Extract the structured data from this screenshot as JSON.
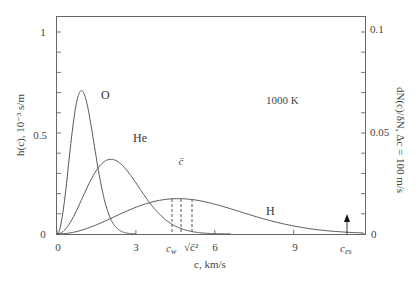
{
  "chart_data": {
    "type": "line",
    "title": "",
    "annotation": "1000 K",
    "xlabel": "c, km/s",
    "ylabel": "h(c), 10^-3 s/m",
    "ylabel_right": "dN(c)/δN, Δc = 100 m/s",
    "xlim": [
      0,
      11.6
    ],
    "ylim": [
      0,
      1.0
    ],
    "ylim_right": [
      0,
      0.1
    ],
    "x_ticks": [
      0,
      3,
      6,
      9
    ],
    "x_tick_labels": [
      "0",
      "3",
      "6",
      "9"
    ],
    "y_ticks": [
      0,
      0.5,
      1
    ],
    "y_tick_labels": [
      "0",
      "0.5",
      "1"
    ],
    "y_minor_step": 0.1,
    "y_right_ticks": [
      0,
      0.05,
      0.1
    ],
    "y_right_tick_labels": [
      "0",
      "0.05",
      "0.1"
    ],
    "grid": false,
    "legend": "inline labels",
    "series": [
      {
        "name": "O",
        "peak_c": 0.93,
        "peak_h": 0.71,
        "x": [
          0,
          0.25,
          0.5,
          0.75,
          0.93,
          1.25,
          1.5,
          2.0,
          2.5,
          2.9
        ],
        "values": [
          0,
          0.12,
          0.42,
          0.66,
          0.71,
          0.6,
          0.44,
          0.15,
          0.03,
          0.0
        ]
      },
      {
        "name": "He",
        "peak_c": 2.05,
        "peak_h": 0.37,
        "x": [
          0,
          0.5,
          1.0,
          1.5,
          2.05,
          2.5,
          3.0,
          3.5,
          4.0,
          4.5,
          5.0,
          5.5,
          6.0
        ],
        "values": [
          0,
          0.07,
          0.2,
          0.32,
          0.37,
          0.34,
          0.26,
          0.16,
          0.09,
          0.04,
          0.015,
          0.005,
          0.0
        ]
      },
      {
        "name": "H",
        "peak_c": 4.6,
        "peak_h": 0.175,
        "x": [
          0,
          1,
          2,
          3,
          4,
          4.6,
          5,
          6,
          7,
          8,
          9,
          10,
          11,
          11.5
        ],
        "values": [
          0,
          0.02,
          0.07,
          0.125,
          0.17,
          0.175,
          0.172,
          0.155,
          0.12,
          0.085,
          0.05,
          0.025,
          0.01,
          0.0
        ]
      }
    ],
    "markers": [
      {
        "label": "c_w",
        "x": 4.3,
        "style": "dashed"
      },
      {
        "label": "c̄",
        "x": 4.65,
        "style": "dashed"
      },
      {
        "label": "√(c̄²)",
        "x": 5.1,
        "style": "dashed"
      },
      {
        "label": "c_es",
        "x": 11.0,
        "style": "arrow"
      }
    ]
  },
  "labels": {
    "O": "O",
    "He": "He",
    "H": "H",
    "temp": "1000 K",
    "xlabel": "c, km/s",
    "ylabel": "h(c), 10⁻³ s/m",
    "ylabel_right": "dN(c)/δN, Δc = 100 m/s",
    "cw": "c",
    "cw_sub": "w",
    "cbar": "c̄",
    "crms": "√c̄²",
    "ces": "c",
    "ces_sub": "es",
    "x0": "0",
    "x3": "3",
    "x6": "6",
    "x9": "9",
    "y0": "0",
    "y05": "0.5",
    "y1": "1",
    "r0": "0",
    "r005": "0.05",
    "r01": "0.1"
  }
}
